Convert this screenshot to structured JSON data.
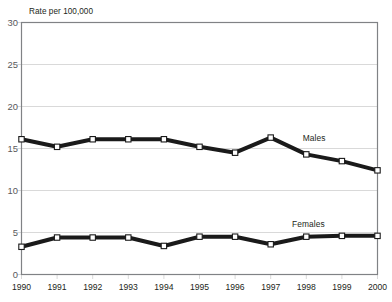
{
  "figure": {
    "clipped_header": "g",
    "axis_caption": "Rate per 100,000"
  },
  "chart_data": {
    "type": "line",
    "title": "",
    "subtitle": "",
    "xlabel": "",
    "ylabel": "Rate per 100,000",
    "categories": [
      "1990",
      "1991",
      "1992",
      "1993",
      "1994",
      "1995",
      "1996",
      "1997",
      "1998",
      "1999",
      "2000"
    ],
    "x": [
      1990,
      1991,
      1992,
      1993,
      1994,
      1995,
      1996,
      1997,
      1998,
      1999,
      2000
    ],
    "series": [
      {
        "name": "Males",
        "color": "#1a1a1a",
        "values": [
          16.1,
          15.2,
          16.1,
          16.1,
          16.1,
          15.2,
          14.5,
          16.3,
          14.3,
          13.5,
          12.4
        ]
      },
      {
        "name": "Females",
        "color": "#1a1a1a",
        "values": [
          3.3,
          4.4,
          4.4,
          4.4,
          3.4,
          4.5,
          4.5,
          3.6,
          4.5,
          4.6,
          4.6
        ]
      }
    ],
    "ylim": [
      0,
      30
    ],
    "yticks": [
      0,
      5,
      10,
      15,
      20,
      25,
      30
    ],
    "ytick_labels": [
      "0",
      "5",
      "10",
      "15",
      "20",
      "25",
      "30"
    ],
    "grid": true,
    "grid_axis": "y",
    "grid_color": "#d9d9d9",
    "legend": "inline-annotations",
    "annotations": [
      {
        "text": "Males",
        "x": 1997.9,
        "y": 16.2
      },
      {
        "text": "Females",
        "x": 1997.6,
        "y": 6.0
      }
    ],
    "marker": "square-open",
    "marker_face_color": "#ffffff",
    "marker_edge_color": "#1a1a1a",
    "line_width_px": 4,
    "axis_color": "#808285",
    "background": "#ffffff"
  }
}
